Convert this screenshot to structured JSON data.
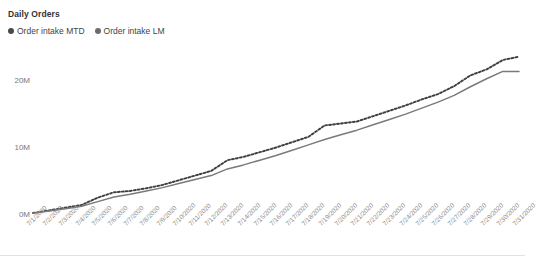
{
  "widget": {
    "title": "Daily Orders",
    "bleed_text_above": ""
  },
  "legend": {
    "position": "top-left",
    "items": [
      {
        "label": "Order intake MTD",
        "color": "#4a4a4a",
        "marker": "circle",
        "style": "dotted"
      },
      {
        "label": "Order intake LM",
        "color": "#6b6b6b",
        "marker": "circle",
        "style": "solid"
      }
    ]
  },
  "colors": {
    "mtd_line": "#3f3f3f",
    "lm_line": "#7a7a7a",
    "axis_text": "#8c8c8c",
    "y_axis_text": "#777777",
    "background": "#ffffff",
    "rule": "#e2e2e2"
  },
  "chart_data": {
    "type": "line",
    "title": "Daily Orders",
    "xlabel": "",
    "ylabel": "",
    "ylim": [
      0,
      25000000
    ],
    "yticks": [
      0,
      10000000,
      20000000
    ],
    "ytick_labels": [
      "0M",
      "10M",
      "20M"
    ],
    "grid": false,
    "legend_position": "top-left",
    "x": [
      "7/1/2020",
      "7/2/2020",
      "7/3/2020",
      "7/4/2020",
      "7/5/2020",
      "7/6/2020",
      "7/7/2020",
      "7/8/2020",
      "7/9/2020",
      "7/10/2020",
      "7/11/2020",
      "7/12/2020",
      "7/13/2020",
      "7/14/2020",
      "7/15/2020",
      "7/16/2020",
      "7/17/2020",
      "7/18/2020",
      "7/19/2020",
      "7/20/2020",
      "7/21/2020",
      "7/22/2020",
      "7/23/2020",
      "7/24/2020",
      "7/25/2020",
      "7/26/2020",
      "7/27/2020",
      "7/28/2020",
      "7/29/2020",
      "7/30/2020",
      "7/31/2020"
    ],
    "xtick_labels": [
      "7/1/2020",
      "7/2/2020",
      "7/3/2020",
      "7/4/2020",
      "7/5/2020",
      "7/6/2020",
      "7/7/2020",
      "7/8/2020",
      "7/9/2020",
      "7/10/2020",
      "7/11/2020",
      "7/12/2020",
      "7/13/2020",
      "7/14/2020",
      "7/15/2020",
      "7/16/2020",
      "7/17/2020",
      "7/18/2020",
      "7/19/2020",
      "7/20/2020",
      "7/21/2020",
      "7/22/2020",
      "7/23/2020",
      "7/24/2020",
      "7/25/2020",
      "7/26/2020",
      "7/27/2020",
      "7/28/2020",
      "7/29/2020",
      "7/30/2020",
      "7/31/2020"
    ],
    "xtick_rotation": -45,
    "series": [
      {
        "name": "Order intake MTD",
        "style": "dotted",
        "color": "#3f3f3f",
        "values": [
          300000,
          700000,
          1100000,
          1500000,
          2600000,
          3400000,
          3600000,
          4000000,
          4500000,
          5200000,
          5900000,
          6600000,
          8200000,
          8700000,
          9400000,
          10100000,
          10900000,
          11700000,
          13400000,
          13700000,
          14000000,
          14800000,
          15600000,
          16400000,
          17300000,
          18100000,
          19300000,
          20900000,
          21800000,
          23200000,
          23700000
        ]
      },
      {
        "name": "Order intake LM",
        "style": "solid",
        "color": "#7a7a7a",
        "values": [
          250000,
          600000,
          950000,
          1300000,
          2000000,
          2700000,
          3100000,
          3600000,
          4100000,
          4700000,
          5300000,
          5900000,
          6900000,
          7500000,
          8200000,
          8900000,
          9700000,
          10500000,
          11300000,
          12000000,
          12700000,
          13500000,
          14300000,
          15100000,
          16000000,
          16900000,
          17900000,
          19200000,
          20400000,
          21500000,
          21500000
        ]
      }
    ]
  }
}
